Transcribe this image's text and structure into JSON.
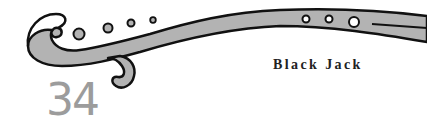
{
  "header": {
    "page_number": "34",
    "title": "Black Jack"
  },
  "ornament": {
    "icon": "decorative-scroll-ornament",
    "fill_color": "#b3b3b3",
    "stroke_color": "#111111"
  },
  "colors": {
    "background": "#ffffff",
    "page_number": "#9c9c9c",
    "title": "#222222"
  }
}
